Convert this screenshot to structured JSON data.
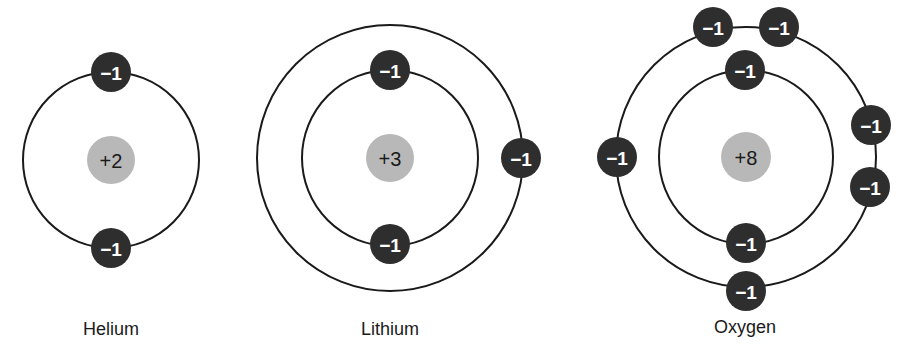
{
  "atoms": [
    {
      "name": "Helium",
      "nucleus_charge": "+2",
      "center": [
        111,
        160
      ],
      "nucleus_radius": 24,
      "orbits": [
        88
      ],
      "electrons": [
        {
          "charge": "−1",
          "x": 111,
          "y": 72
        },
        {
          "charge": "−1",
          "x": 111,
          "y": 248
        }
      ],
      "label_pos": [
        111,
        330
      ]
    },
    {
      "name": "Lithium",
      "nucleus_charge": "+3",
      "center": [
        390,
        158
      ],
      "nucleus_radius": 24,
      "orbits": [
        88,
        133
      ],
      "electrons": [
        {
          "charge": "−1",
          "x": 390,
          "y": 70
        },
        {
          "charge": "−1",
          "x": 390,
          "y": 244
        },
        {
          "charge": "−1",
          "x": 521,
          "y": 158
        }
      ],
      "label_pos": [
        390,
        330
      ]
    },
    {
      "name": "Oxygen",
      "nucleus_charge": "+8",
      "center": [
        746,
        157
      ],
      "nucleus_radius": 25,
      "orbits": [
        87,
        130
      ],
      "electrons": [
        {
          "charge": "−1",
          "x": 745,
          "y": 70
        },
        {
          "charge": "−1",
          "x": 746,
          "y": 243
        },
        {
          "charge": "−1",
          "x": 713,
          "y": 27
        },
        {
          "charge": "−1",
          "x": 779,
          "y": 27
        },
        {
          "charge": "−1",
          "x": 617,
          "y": 157
        },
        {
          "charge": "−1",
          "x": 871,
          "y": 125
        },
        {
          "charge": "−1",
          "x": 870,
          "y": 187
        },
        {
          "charge": "−1",
          "x": 746,
          "y": 291
        }
      ],
      "label_pos": [
        745,
        328
      ]
    }
  ],
  "electron_radius": 20,
  "colors": {
    "orbit": "#1a1a1a",
    "nucleus": "#b8b8b8",
    "electron": "#2e2e2e",
    "electron_text": "#ffffff"
  }
}
